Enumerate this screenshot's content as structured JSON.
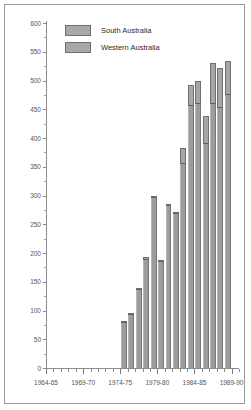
{
  "chart_data": {
    "type": "bar",
    "title": "",
    "subtitle": "",
    "xlabel": "",
    "ylabel": "",
    "ylim": [
      0,
      600
    ],
    "ytick_step": 50,
    "grid": false,
    "stacked": true,
    "legend_position": "top-left-inside",
    "x_axis_tick_labels": [
      "1964-65",
      "1969-70",
      "1974-75",
      "1979-80",
      "1984-85",
      "1989-90"
    ],
    "y_axis_tick_labels": [
      "0",
      "50",
      "100",
      "150",
      "200",
      "250",
      "300",
      "350",
      "400",
      "450",
      "500",
      "550",
      "600"
    ],
    "categories": [
      "1974-75",
      "1975-76",
      "1976-77",
      "1977-78",
      "1978-79",
      "1979-80",
      "1980-81",
      "1981-82",
      "1982-83",
      "1983-84",
      "1984-85",
      "1985-86",
      "1986-87",
      "1987-88",
      "1988-89"
    ],
    "series": [
      {
        "name": "Western Australia",
        "color": "#9c9c9c",
        "values": [
          80,
          94,
          136,
          188,
          297,
          184,
          281,
          268,
          355,
          456,
          459,
          390,
          459,
          453,
          474
        ]
      },
      {
        "name": "South Australia",
        "color": "#a6a6a6",
        "values": [
          2,
          2,
          4,
          5,
          3,
          4,
          5,
          4,
          27,
          36,
          40,
          48,
          71,
          69,
          60
        ]
      }
    ],
    "totals": [
      82,
      96,
      140,
      193,
      300,
      188,
      286,
      272,
      382,
      492,
      499,
      438,
      530,
      522,
      534
    ]
  },
  "legend": {
    "items": [
      {
        "label": "South Australia",
        "color": "#a6a6a6"
      },
      {
        "label": "Western Australia",
        "color": "#9c9c9c"
      }
    ]
  },
  "axes": {
    "y_labels": [
      "600",
      "550",
      "500",
      "450",
      "400",
      "350",
      "300",
      "250",
      "200",
      "150",
      "100",
      "50",
      "0"
    ],
    "x_labels": [
      "1964-65",
      "1969-70",
      "1974-75",
      "1979-80",
      "1984-85",
      "1989-90"
    ]
  },
  "colors": {
    "frame_border": "#9a9a9a",
    "axis": "#8a8a8a",
    "tick_text": "#555555",
    "legend_text": "#2b2b2b",
    "bar_lower": "#9c9c9c",
    "bar_upper": "#a6a6a6"
  }
}
